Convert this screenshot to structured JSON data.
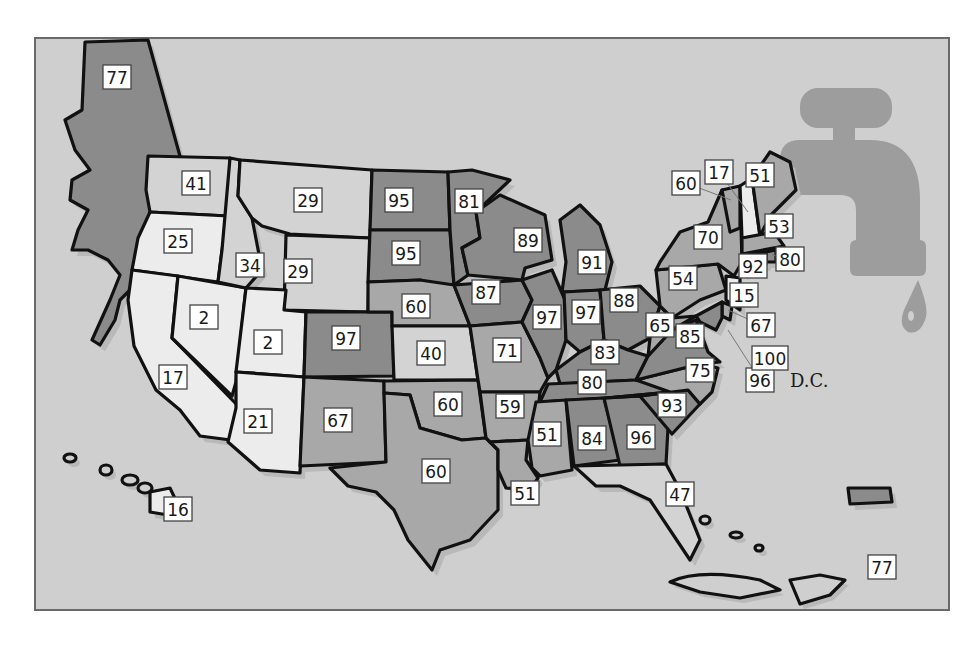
{
  "map": {
    "colors": {
      "background": "#cfcfcf",
      "faucet": "#9d9d9d",
      "bins": [
        {
          "min": 0,
          "max": 25,
          "color": "#ececec"
        },
        {
          "min": 26,
          "max": 50,
          "color": "#d3d3d3"
        },
        {
          "min": 51,
          "max": 75,
          "color": "#a8a8a8"
        },
        {
          "min": 76,
          "max": 100,
          "color": "#8b8b8b"
        }
      ]
    },
    "dc_label": "D.C.",
    "regions": [
      {
        "id": "AK",
        "name": "Alaska",
        "value": 77
      },
      {
        "id": "WA",
        "name": "Washington",
        "value": 41
      },
      {
        "id": "OR",
        "name": "Oregon",
        "value": 25
      },
      {
        "id": "CA",
        "name": "California",
        "value": 17
      },
      {
        "id": "NV",
        "name": "Nevada",
        "value": 2
      },
      {
        "id": "ID",
        "name": "Idaho",
        "value": 34
      },
      {
        "id": "MT",
        "name": "Montana",
        "value": 29
      },
      {
        "id": "WY",
        "name": "Wyoming",
        "value": 29
      },
      {
        "id": "UT",
        "name": "Utah",
        "value": 2
      },
      {
        "id": "AZ",
        "name": "Arizona",
        "value": 21
      },
      {
        "id": "CO",
        "name": "Colorado",
        "value": 97
      },
      {
        "id": "NM",
        "name": "New Mexico",
        "value": 67
      },
      {
        "id": "ND",
        "name": "North Dakota",
        "value": 95
      },
      {
        "id": "SD",
        "name": "South Dakota",
        "value": 95
      },
      {
        "id": "NE",
        "name": "Nebraska",
        "value": 60
      },
      {
        "id": "KS",
        "name": "Kansas",
        "value": 40
      },
      {
        "id": "OK",
        "name": "Oklahoma",
        "value": 60
      },
      {
        "id": "TX",
        "name": "Texas",
        "value": 60
      },
      {
        "id": "MN",
        "name": "Minnesota",
        "value": 81
      },
      {
        "id": "IA",
        "name": "Iowa",
        "value": 87
      },
      {
        "id": "MO",
        "name": "Missouri",
        "value": 71
      },
      {
        "id": "AR",
        "name": "Arkansas",
        "value": 59
      },
      {
        "id": "LA",
        "name": "Louisiana",
        "value": 51
      },
      {
        "id": "WI",
        "name": "Wisconsin",
        "value": 89
      },
      {
        "id": "IL",
        "name": "Illinois",
        "value": 97
      },
      {
        "id": "MI",
        "name": "Michigan",
        "value": 91
      },
      {
        "id": "IN",
        "name": "Indiana",
        "value": 97
      },
      {
        "id": "OH",
        "name": "Ohio",
        "value": 88
      },
      {
        "id": "KY",
        "name": "Kentucky",
        "value": 83
      },
      {
        "id": "TN",
        "name": "Tennessee",
        "value": 80
      },
      {
        "id": "MS",
        "name": "Mississippi",
        "value": 51
      },
      {
        "id": "AL",
        "name": "Alabama",
        "value": 84
      },
      {
        "id": "GA",
        "name": "Georgia",
        "value": 96
      },
      {
        "id": "FL",
        "name": "Florida",
        "value": 47
      },
      {
        "id": "SC",
        "name": "South Carolina",
        "value": 93
      },
      {
        "id": "NC",
        "name": "North Carolina",
        "value": 75
      },
      {
        "id": "VA",
        "name": "Virginia",
        "value": 85
      },
      {
        "id": "WV",
        "name": "West Virginia",
        "value": 65
      },
      {
        "id": "PA",
        "name": "Pennsylvania",
        "value": 54
      },
      {
        "id": "NY",
        "name": "New York",
        "value": 70
      },
      {
        "id": "VT",
        "name": "Vermont",
        "value": 60
      },
      {
        "id": "NH",
        "name": "New Hampshire",
        "value": 17
      },
      {
        "id": "ME",
        "name": "Maine",
        "value": 51
      },
      {
        "id": "MA",
        "name": "Massachusetts",
        "value": 53
      },
      {
        "id": "RI",
        "name": "Rhode Island",
        "value": 80
      },
      {
        "id": "CT",
        "name": "Connecticut",
        "value": 92
      },
      {
        "id": "NJ",
        "name": "New Jersey",
        "value": 15
      },
      {
        "id": "DE",
        "name": "Delaware",
        "value": 67
      },
      {
        "id": "MD",
        "name": "Maryland",
        "value": 96
      },
      {
        "id": "DC",
        "name": "District of Columbia",
        "value": 100
      },
      {
        "id": "HI",
        "name": "Hawaii",
        "value": 16
      },
      {
        "id": "PR",
        "name": "Puerto Rico",
        "value": 77
      }
    ]
  }
}
